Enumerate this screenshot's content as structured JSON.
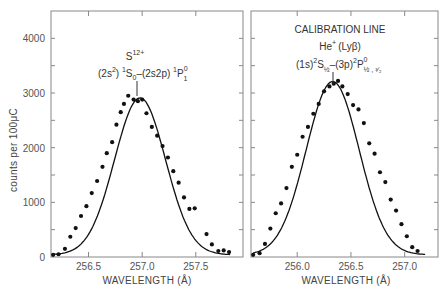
{
  "chart_data": [
    {
      "type": "scatter",
      "title": "",
      "annotation": {
        "ion": "S12+",
        "transition": "(2s²) ¹S₀ – (2s2p) ¹P⁰₁"
      },
      "xlabel": "WAVELENGTH (Å)",
      "ylabel": "counts per 100μC",
      "xlim": [
        256.15,
        257.94
      ],
      "ylim": [
        0,
        4500
      ],
      "xticks": [
        256.5,
        257.0,
        257.5
      ],
      "xtick_labels": [
        "256.5",
        "257.0",
        "257.5"
      ],
      "yticks": [
        0,
        1000,
        2000,
        3000,
        4000
      ],
      "ytick_labels": [
        "0",
        "1000",
        "2000",
        "3000",
        "4000"
      ],
      "grid": false,
      "series": [
        {
          "name": "measured",
          "style": "points",
          "x": [
            256.17,
            256.22,
            256.28,
            256.33,
            256.38,
            256.43,
            256.48,
            256.53,
            256.58,
            256.63,
            256.67,
            256.72,
            256.76,
            256.8,
            256.83,
            256.87,
            256.92,
            256.96,
            257.0,
            257.04,
            257.09,
            257.14,
            257.19,
            257.24,
            257.29,
            257.34,
            257.39,
            257.44,
            257.49,
            257.6,
            257.65,
            257.71,
            257.76,
            257.81
          ],
          "y": [
            40,
            50,
            150,
            370,
            530,
            750,
            930,
            1170,
            1390,
            1650,
            1900,
            2100,
            2420,
            2650,
            2800,
            2950,
            2880,
            2850,
            2880,
            2630,
            2380,
            2220,
            2030,
            1820,
            1570,
            1360,
            1090,
            880,
            890,
            420,
            230,
            110,
            120,
            90
          ]
        },
        {
          "name": "fit",
          "style": "line",
          "center": 256.98,
          "peak": 2870,
          "fwhm": 0.56
        }
      ]
    },
    {
      "type": "scatter",
      "title": "CALIBRATION LINE",
      "annotation": {
        "ion": "He⁺ (Lyβ)",
        "transition": "(1s)² S½ – (3p)² P⁰½, ³⁄₂"
      },
      "xlabel": "WAVELENGTH (Å)",
      "ylabel": "counts per 100μC",
      "xlim": [
        255.57,
        257.31
      ],
      "ylim": [
        0,
        4500
      ],
      "xticks": [
        256.0,
        256.5,
        257.0
      ],
      "xtick_labels": [
        "256.0",
        "256.5",
        "257.0"
      ],
      "yticks": [
        0,
        1000,
        2000,
        3000,
        4000
      ],
      "ytick_labels": [],
      "grid": false,
      "series": [
        {
          "name": "measured",
          "style": "points",
          "x": [
            255.59,
            255.65,
            255.7,
            255.75,
            255.8,
            255.85,
            255.9,
            255.95,
            256.0,
            256.05,
            256.1,
            256.15,
            256.2,
            256.25,
            256.3,
            256.34,
            256.38,
            256.42,
            256.47,
            256.52,
            256.57,
            256.62,
            256.67,
            256.72,
            256.77,
            256.82,
            256.87,
            256.92,
            256.97,
            257.02,
            257.07,
            257.12
          ],
          "y": [
            40,
            70,
            240,
            520,
            800,
            980,
            1260,
            1650,
            1870,
            2200,
            2380,
            2620,
            2800,
            3030,
            3120,
            3170,
            3220,
            3120,
            2980,
            2780,
            2700,
            2450,
            2080,
            1890,
            1550,
            1370,
            1050,
            850,
            600,
            380,
            180,
            110
          ]
        },
        {
          "name": "fit",
          "style": "line",
          "center": 256.33,
          "peak": 3170,
          "fwhm": 0.58
        }
      ]
    }
  ],
  "labels": {
    "ylabel": "counts per 100μC",
    "left_xlabel": "WAVELENGTH (Å)",
    "right_xlabel": "WAVELENGTH (Å)",
    "left_ion": "S",
    "left_ion_charge": "12+",
    "left_transition_a": "(2s",
    "left_transition_b": ") ",
    "left_transition_c": "S",
    "left_transition_d": "–(2s2p) ",
    "left_transition_e": "P",
    "right_title": "CALIBRATION LINE",
    "right_ion": "He",
    "right_ion_charge": "+",
    "right_ion_line": "(Lyβ)",
    "right_transition_a": "(1s)",
    "right_transition_b": "S",
    "right_transition_c": "–(3p)",
    "right_transition_d": "P",
    "right_transition_sub": "½ , ³⁄₂"
  }
}
